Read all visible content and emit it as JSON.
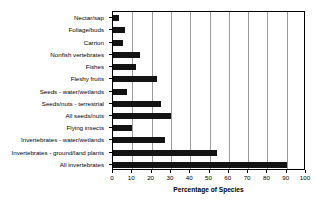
{
  "chart_data": {
    "type": "bar",
    "orientation": "horizontal",
    "title": "",
    "xlabel": "Percentage of Species",
    "ylabel": "",
    "xlim": [
      0,
      100
    ],
    "xticks": [
      0,
      10,
      20,
      30,
      40,
      50,
      60,
      70,
      80,
      90,
      100
    ],
    "grid": "vertical",
    "legend": "none",
    "bar_color": "#131313",
    "categories": [
      "Nectar/sap",
      "Foliage/buds",
      "Carrion",
      "Nonfish vertebrates",
      "Fishes",
      "Fleshy fruits",
      "Seeds - water/wetlands",
      "Seeds/nuts - terrestrial",
      "All seeds/nuts",
      "Flying insects",
      "Invertebrates - water/wetlands",
      "Invertebrates - ground/land plants",
      "All invertebrates"
    ],
    "values": [
      3,
      6,
      5,
      14,
      12,
      23,
      7,
      25,
      30,
      10,
      27,
      54,
      90
    ]
  }
}
